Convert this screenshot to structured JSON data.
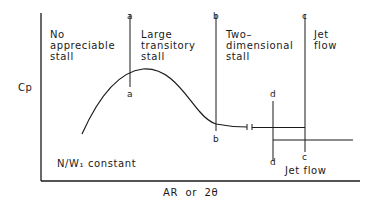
{
  "diagram": {
    "y_axis_label": "Cp",
    "x_axis_label": "AR  or  2θ",
    "condition_note": "N/W₁ constant",
    "regions": [
      {
        "id": "no-stall",
        "label": "No\nappreciable\nstall"
      },
      {
        "id": "large-transitory",
        "label": "Large\ntransitory\nstall"
      },
      {
        "id": "two-dimensional",
        "label": "Two–\ndimensional\nstall"
      },
      {
        "id": "jet-flow-upper",
        "label": "Jet\nflow"
      },
      {
        "id": "jet-flow-lower",
        "label": "Jet flow"
      }
    ],
    "boundary_lines": [
      {
        "id": "a",
        "top_label": "a",
        "bottom_label": "a"
      },
      {
        "id": "b",
        "top_label": "b",
        "bottom_label": "b"
      },
      {
        "id": "c",
        "top_label": "c",
        "bottom_label": "c"
      },
      {
        "id": "d",
        "top_label": "d",
        "bottom_label": "d"
      }
    ]
  }
}
